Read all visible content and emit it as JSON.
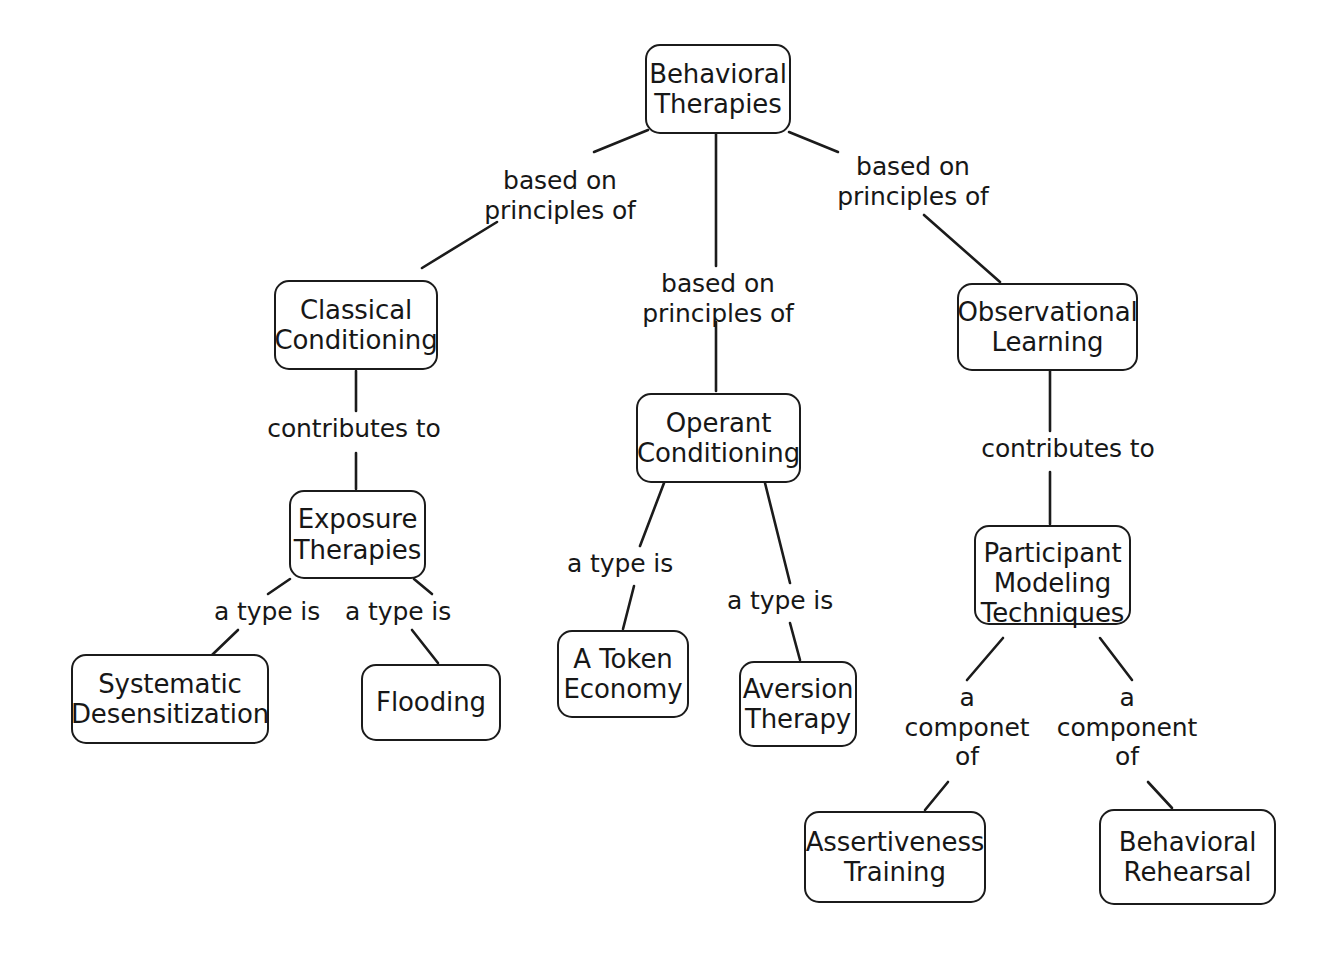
{
  "diagram": {
    "type": "concept-map",
    "background_color": "#ffffff",
    "stroke_color": "#1b1b1b",
    "text_color": "#171717"
  },
  "nodes": [
    {
      "id": "behavioral-therapies",
      "label": "Behavioral\nTherapies",
      "x": 645,
      "y": 44,
      "w": 146,
      "h": 90
    },
    {
      "id": "classical-conditioning",
      "label": "Classical\nConditioning",
      "x": 274,
      "y": 280,
      "w": 164,
      "h": 90
    },
    {
      "id": "operant-conditioning",
      "label": "Operant\nConditioning",
      "x": 636,
      "y": 393,
      "w": 165,
      "h": 90
    },
    {
      "id": "observational-learning",
      "label": "Observational\nLearning",
      "x": 957,
      "y": 283,
      "w": 181,
      "h": 88
    },
    {
      "id": "exposure-therapies",
      "label": "Exposure\nTherapies",
      "x": 289,
      "y": 490,
      "w": 137,
      "h": 89
    },
    {
      "id": "systematic-desensitization",
      "label": "Systematic\nDesensitization",
      "x": 71,
      "y": 654,
      "w": 198,
      "h": 90
    },
    {
      "id": "flooding",
      "label": "Flooding",
      "x": 361,
      "y": 664,
      "w": 140,
      "h": 77
    },
    {
      "id": "a-token-economy",
      "label": "A Token\nEconomy",
      "x": 557,
      "y": 630,
      "w": 132,
      "h": 88
    },
    {
      "id": "aversion-therapy",
      "label": "Aversion\nTherapy",
      "x": 739,
      "y": 661,
      "w": 118,
      "h": 86
    },
    {
      "id": "participant-modeling-techniques",
      "label": "Participant\nModeling\nTechniques",
      "x": 974,
      "y": 525,
      "w": 157,
      "h": 100,
      "overflow": true
    },
    {
      "id": "assertiveness-training",
      "label": "Assertiveness\nTraining",
      "x": 804,
      "y": 811,
      "w": 182,
      "h": 92
    },
    {
      "id": "behavioral-rehearsal",
      "label": "Behavioral\nRehearsal",
      "x": 1099,
      "y": 809,
      "w": 177,
      "h": 96
    }
  ],
  "edge_labels": [
    {
      "id": "label-bt-cc",
      "text": "based on\nprinciples of",
      "x": 470,
      "y": 166,
      "w": 180
    },
    {
      "id": "label-bt-oc",
      "text": "based on\nprinciples of",
      "x": 628,
      "y": 269,
      "w": 180
    },
    {
      "id": "label-bt-ol",
      "text": "based on\nprinciples of",
      "x": 823,
      "y": 152,
      "w": 180
    },
    {
      "id": "label-cc-et",
      "text": "contributes to",
      "x": 246,
      "y": 414,
      "w": 216
    },
    {
      "id": "label-ol-pmt",
      "text": "contributes to",
      "x": 960,
      "y": 434,
      "w": 216
    },
    {
      "id": "label-et-sd",
      "text": "a type is",
      "x": 205,
      "y": 597,
      "w": 124
    },
    {
      "id": "label-et-fl",
      "text": "a type is",
      "x": 336,
      "y": 597,
      "w": 124
    },
    {
      "id": "label-oc-ate",
      "text": "a type is",
      "x": 558,
      "y": 549,
      "w": 124
    },
    {
      "id": "label-oc-av",
      "text": "a type is",
      "x": 718,
      "y": 586,
      "w": 124
    },
    {
      "id": "label-pmt-at",
      "text": "a\ncomponet\nof",
      "x": 894,
      "y": 683,
      "w": 146
    },
    {
      "id": "label-pmt-br",
      "text": "a\ncomponent\nof",
      "x": 1054,
      "y": 683,
      "w": 146
    }
  ],
  "edges": [
    {
      "id": "edge-bt-cc",
      "from": "behavioral-therapies",
      "to": "classical-conditioning",
      "points": "594,152 648,130"
    },
    {
      "id": "edge-bt-cc2",
      "from": "behavioral-therapies",
      "to": "classical-conditioning",
      "points": "422,268 497,222"
    },
    {
      "id": "edge-bt-oc",
      "from": "behavioral-therapies",
      "to": "operant-conditioning",
      "points": "716,134 716,266"
    },
    {
      "id": "edge-bt-oc2",
      "from": "behavioral-therapies",
      "to": "operant-conditioning",
      "points": "716,322 716,391"
    },
    {
      "id": "edge-bt-ol",
      "from": "behavioral-therapies",
      "to": "observational-learning",
      "points": "789,132 838,152"
    },
    {
      "id": "edge-bt-ol2",
      "from": "behavioral-therapies",
      "to": "observational-learning",
      "points": "924,215 1000,282"
    },
    {
      "id": "edge-cc-et",
      "from": "classical-conditioning",
      "to": "exposure-therapies",
      "points": "356,371 356,411"
    },
    {
      "id": "edge-cc-et2",
      "from": "classical-conditioning",
      "to": "exposure-therapies",
      "points": "356,453 356,489"
    },
    {
      "id": "edge-et-sd",
      "from": "exposure-therapies",
      "to": "systematic-desensitization",
      "points": "290,579 268,594"
    },
    {
      "id": "edge-et-sd2",
      "from": "exposure-therapies",
      "to": "systematic-desensitization",
      "points": "238,630 212,655"
    },
    {
      "id": "edge-et-fl",
      "from": "exposure-therapies",
      "to": "flooding",
      "points": "414,579 432,594"
    },
    {
      "id": "edge-et-fl2",
      "from": "exposure-therapies",
      "to": "flooding",
      "points": "412,630 438,663"
    },
    {
      "id": "edge-oc-ate",
      "from": "operant-conditioning",
      "to": "a-token-economy",
      "points": "664,483 640,546"
    },
    {
      "id": "edge-oc-ate2",
      "from": "operant-conditioning",
      "to": "a-token-economy",
      "points": "634,586 623,629"
    },
    {
      "id": "edge-oc-av",
      "from": "operant-conditioning",
      "to": "aversion-therapy",
      "points": "765,483 790,583"
    },
    {
      "id": "edge-oc-av2",
      "from": "operant-conditioning",
      "to": "aversion-therapy",
      "points": "790,623 800,660"
    },
    {
      "id": "edge-ol-pmt",
      "from": "observational-learning",
      "to": "participant-modeling-techniques",
      "points": "1050,371 1050,431"
    },
    {
      "id": "edge-ol-pmt2",
      "from": "observational-learning",
      "to": "participant-modeling-techniques",
      "points": "1050,472 1050,524"
    },
    {
      "id": "edge-pmt-at",
      "from": "participant-modeling-techniques",
      "to": "assertiveness-training",
      "points": "1003,638 967,680"
    },
    {
      "id": "edge-pmt-at2",
      "from": "participant-modeling-techniques",
      "to": "assertiveness-training",
      "points": "948,782 925,810"
    },
    {
      "id": "edge-pmt-br",
      "from": "participant-modeling-techniques",
      "to": "behavioral-rehearsal",
      "points": "1100,638 1132,680"
    },
    {
      "id": "edge-pmt-br2",
      "from": "participant-modeling-techniques",
      "to": "behavioral-rehearsal",
      "points": "1148,782 1172,808"
    }
  ]
}
